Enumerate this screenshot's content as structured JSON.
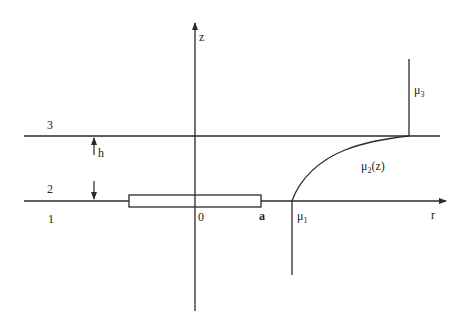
{
  "diagram": {
    "axes": {
      "z_label": "z",
      "r_label": "r",
      "origin_label": "0"
    },
    "regions": {
      "region_1": "1",
      "region_2": "2",
      "region_3": "3"
    },
    "layer_thickness_label": "h",
    "electrode_end_label": "a",
    "boundaries": {
      "mu1": "μ",
      "mu1_sub": "1",
      "mu2": "μ",
      "mu2_sub": "2",
      "mu2_arg": "(z)",
      "mu3": "μ",
      "mu3_sub": "3"
    },
    "colors": {
      "line": "#2a2a2a",
      "background": "#ffffff"
    }
  }
}
